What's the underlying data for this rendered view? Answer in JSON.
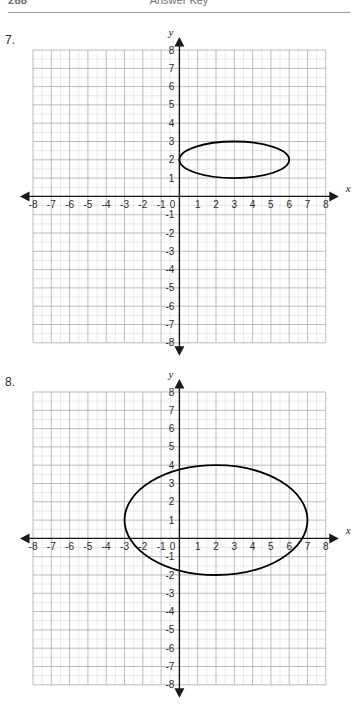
{
  "header": {
    "page_number": "288",
    "kicker": "Answer Key"
  },
  "problems": [
    {
      "number": "7.",
      "axis_x_label": "x",
      "axis_y_label": "y",
      "x_ticks": [
        "-8",
        "-7",
        "-6",
        "-5",
        "-4",
        "-3",
        "-2",
        "-1",
        "0",
        "1",
        "2",
        "3",
        "4",
        "5",
        "6",
        "7",
        "8"
      ],
      "y_ticks": [
        "8",
        "7",
        "6",
        "5",
        "4",
        "3",
        "2",
        "1",
        "-1",
        "-2",
        "-3",
        "-4",
        "-5",
        "-6",
        "-7",
        "-8"
      ],
      "origin_label": "0"
    },
    {
      "number": "8.",
      "axis_x_label": "x",
      "axis_y_label": "y",
      "x_ticks": [
        "-8",
        "-7",
        "-6",
        "-5",
        "-4",
        "-3",
        "-2",
        "-1",
        "0",
        "1",
        "2",
        "3",
        "4",
        "5",
        "6",
        "7",
        "8"
      ],
      "y_ticks": [
        "8",
        "7",
        "6",
        "5",
        "4",
        "3",
        "2",
        "1",
        "-1",
        "-2",
        "-3",
        "-4",
        "-5",
        "-6",
        "-7",
        "-8"
      ],
      "origin_label": "0"
    }
  ],
  "chart_data": [
    {
      "type": "scatter",
      "title": "7.",
      "xlabel": "x",
      "ylabel": "y",
      "xlim": [
        -8,
        8
      ],
      "ylim": [
        -8,
        8
      ],
      "grid": true,
      "grid_minor_step": 0.5,
      "grid_major_step": 1,
      "series": [
        {
          "name": "ellipse",
          "shape": "ellipse",
          "center": [
            3,
            2
          ],
          "semi_axis_x": 3,
          "semi_axis_y": 1,
          "x_intercepts_extent": [
            0,
            6
          ],
          "y_intercepts_extent": [
            1,
            3
          ],
          "color": "#000000"
        }
      ]
    },
    {
      "type": "scatter",
      "title": "8.",
      "xlabel": "x",
      "ylabel": "y",
      "xlim": [
        -8,
        8
      ],
      "ylim": [
        -8,
        8
      ],
      "grid": true,
      "grid_minor_step": 0.5,
      "grid_major_step": 1,
      "series": [
        {
          "name": "ellipse",
          "shape": "ellipse",
          "center": [
            2,
            1
          ],
          "semi_axis_x": 5,
          "semi_axis_y": 3,
          "x_intercepts_extent": [
            -3,
            7
          ],
          "y_intercepts_extent": [
            -2,
            4
          ],
          "color": "#000000"
        }
      ]
    }
  ],
  "colors": {
    "ink": "#000000",
    "grid_minor": "#d8d8e0",
    "grid_major": "#a9a9b4",
    "axis": "#1a1a1a",
    "header_text": "#6f6f6f"
  }
}
